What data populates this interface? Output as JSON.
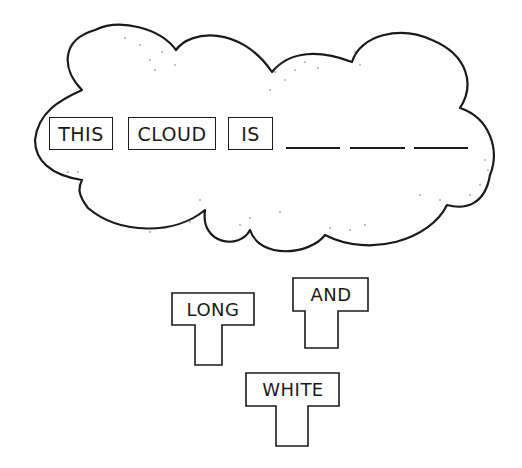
{
  "sentence": {
    "words": [
      "THIS",
      "CLOUD",
      "IS"
    ],
    "blanks": 3
  },
  "tiles": {
    "long": "LONG",
    "and": "AND",
    "white": "WHITE"
  }
}
